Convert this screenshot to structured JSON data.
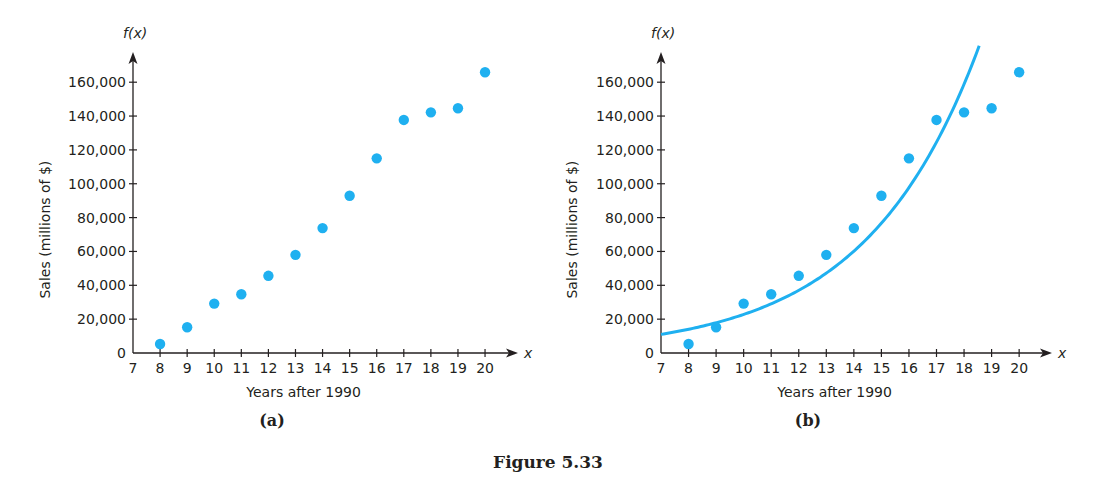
{
  "figure": {
    "caption": "Figure 5.33",
    "point_color": "#1fb0f0",
    "curve_color": "#1fb0f0",
    "axis_color": "#231f20"
  },
  "chart_data": [
    {
      "type": "scatter",
      "panel_label": "(a)",
      "title": "",
      "xlabel": "Years after 1990",
      "ylabel": "Sales (millions of $)",
      "y_axis_symbol": "f(x)",
      "x_axis_symbol": "x",
      "xlim": [
        7,
        21
      ],
      "ylim": [
        0,
        170000
      ],
      "x_ticks": [
        7,
        8,
        9,
        10,
        11,
        12,
        13,
        14,
        15,
        16,
        17,
        18,
        19,
        20
      ],
      "y_ticks": [
        0,
        20000,
        40000,
        60000,
        80000,
        100000,
        120000,
        140000,
        160000
      ],
      "y_tick_labels": [
        "0",
        "20,000",
        "40,000",
        "60,000",
        "80,000",
        "100,000",
        "120,000",
        "140,000",
        "160,000"
      ],
      "grid": false,
      "series": [
        {
          "name": "Sales",
          "x": [
            8,
            9,
            10,
            11,
            12,
            13,
            14,
            15,
            16,
            17,
            18,
            19,
            20
          ],
          "y": [
            5300,
            15200,
            29200,
            34700,
            45600,
            58000,
            73800,
            92900,
            115000,
            137700,
            142200,
            144600,
            165900
          ]
        }
      ]
    },
    {
      "type": "scatter",
      "panel_label": "(b)",
      "title": "",
      "xlabel": "Years after 1990",
      "ylabel": "Sales (millions of $)",
      "y_axis_symbol": "f(x)",
      "x_axis_symbol": "x",
      "xlim": [
        7,
        21
      ],
      "ylim": [
        0,
        170000
      ],
      "x_ticks": [
        7,
        8,
        9,
        10,
        11,
        12,
        13,
        14,
        15,
        16,
        17,
        18,
        19,
        20
      ],
      "y_ticks": [
        0,
        20000,
        40000,
        60000,
        80000,
        100000,
        120000,
        140000,
        160000
      ],
      "y_tick_labels": [
        "0",
        "20,000",
        "40,000",
        "60,000",
        "80,000",
        "100,000",
        "120,000",
        "140,000",
        "160,000"
      ],
      "grid": false,
      "series": [
        {
          "name": "Sales",
          "x": [
            8,
            9,
            10,
            11,
            12,
            13,
            14,
            15,
            16,
            17,
            18,
            19,
            20
          ],
          "y": [
            5300,
            15200,
            29200,
            34700,
            45600,
            58000,
            73800,
            92900,
            115000,
            137700,
            142200,
            144600,
            165900
          ]
        }
      ],
      "fit_curve": {
        "type": "exponential",
        "formula": "f(x) = a * b^(x - 7)",
        "a": 11000,
        "b": 1.2747,
        "x_range": [
          7,
          18.55
        ]
      }
    }
  ]
}
